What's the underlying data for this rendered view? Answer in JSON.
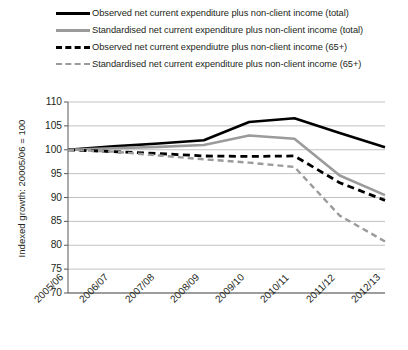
{
  "legend": {
    "position": "top",
    "items": [
      {
        "label": "Observed net current expenditure plus non-client income (total)",
        "style": "solid",
        "color": "#000000",
        "icon": "line-solid-black-icon"
      },
      {
        "label": "Standardised net current expenditure plus non-client income (total)",
        "style": "solid",
        "color": "#9b9b9b",
        "icon": "line-solid-grey-icon"
      },
      {
        "label": "Observed net current expendiutre plus non-client income (65+)",
        "style": "dashed",
        "color": "#000000",
        "icon": "line-dashed-black-icon"
      },
      {
        "label": "Standardised net current expenditure plus non-client income (65+)",
        "style": "dashed",
        "color": "#9b9b9b",
        "icon": "line-dashed-grey-icon"
      }
    ]
  },
  "axis": {
    "y_title": "Indexed growth: 20005/06 = 100",
    "y_ticks": [
      110,
      105,
      100,
      95,
      90,
      85,
      80,
      75,
      70
    ],
    "x_ticks": [
      "2005/06",
      "2006/07",
      "2007/08",
      "2008/09",
      "2009/10",
      "2010/11",
      "2011/12",
      "2012/13"
    ]
  },
  "colors": {
    "black": "#000000",
    "grey": "#9b9b9b",
    "gridline": "#b3b3b3",
    "axis": "#595959",
    "background": "#ffffff"
  },
  "chart_data": {
    "type": "line",
    "title": "",
    "xlabel": "",
    "ylabel": "Indexed growth: 20005/06 = 100",
    "categories": [
      "2005/06",
      "2006/07",
      "2007/08",
      "2008/09",
      "2009/10",
      "2010/11",
      "2011/12",
      "2012/13"
    ],
    "ylim": [
      70,
      110
    ],
    "ytick_step": 5,
    "grid": true,
    "legend_position": "top",
    "series": [
      {
        "name": "Observed net current expenditure plus non-client income (total)",
        "style": "solid",
        "color": "#000000",
        "values": [
          100.0,
          100.7,
          101.3,
          102.0,
          105.8,
          106.6,
          103.5,
          100.5
        ]
      },
      {
        "name": "Standardised net current expenditure plus non-client income (total)",
        "style": "solid",
        "color": "#9b9b9b",
        "values": [
          100.0,
          100.3,
          100.6,
          101.0,
          103.0,
          102.3,
          94.6,
          90.5
        ]
      },
      {
        "name": "Observed net current expendiutre plus non-client income (65+)",
        "style": "dashed",
        "color": "#000000",
        "values": [
          100.0,
          99.6,
          99.2,
          98.7,
          98.6,
          98.7,
          93.1,
          89.4
        ]
      },
      {
        "name": "Standardised net current expenditure plus non-client income (65+)",
        "style": "dashed",
        "color": "#9b9b9b",
        "values": [
          100.0,
          99.6,
          98.8,
          98.0,
          97.3,
          96.4,
          86.2,
          80.8
        ]
      }
    ]
  }
}
